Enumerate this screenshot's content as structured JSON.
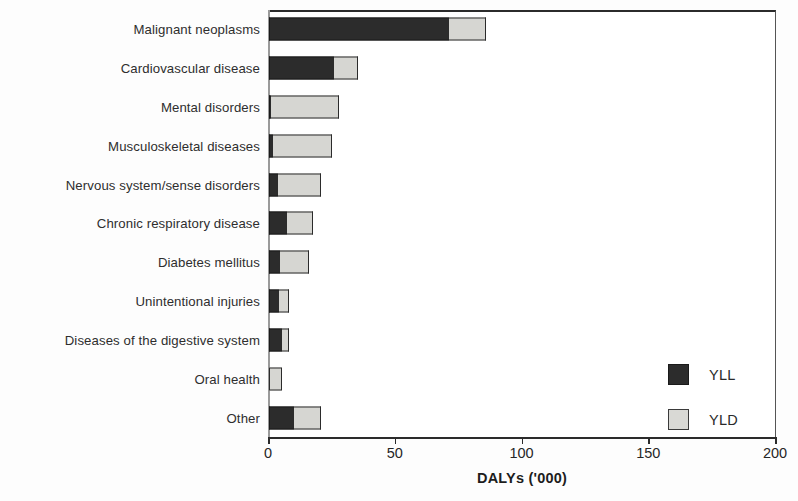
{
  "chart_data": {
    "type": "bar",
    "orientation": "horizontal",
    "stacked": true,
    "title": "",
    "xlabel": "DALYs ('000)",
    "ylabel": "",
    "xlim": [
      0,
      200
    ],
    "xticks": [
      0,
      50,
      100,
      150,
      200
    ],
    "xtick_labels": [
      "0",
      "50",
      "100",
      "150",
      "200"
    ],
    "grid": false,
    "legend_position": "bottom-right",
    "categories": [
      "Malignant neoplasms",
      "Cardiovascular disease",
      "Mental disorders",
      "Musculoskeletal diseases",
      "Nervous system/sense disorders",
      "Chronic respiratory disease",
      "Diabetes mellitus",
      "Unintentional injuries",
      "Diseases of the digestive system",
      "Oral health",
      "Other"
    ],
    "series": [
      {
        "name": "YLL",
        "color": "#2c2c2c",
        "values": [
          71,
          25.5,
          0.8,
          1.5,
          3.5,
          7,
          4.3,
          4,
          5,
          0,
          10
        ]
      },
      {
        "name": "YLD",
        "color": "#d6d6d2",
        "values": [
          14.5,
          9.5,
          26.8,
          23.3,
          17,
          10.4,
          11.5,
          4,
          2.8,
          5,
          10.5
        ]
      }
    ],
    "totals": [
      85.5,
      35,
      27.6,
      24.8,
      20.5,
      17.4,
      15.8,
      8,
      7.8,
      5,
      20.5
    ]
  },
  "legend": {
    "items": [
      {
        "label": "YLL",
        "swatch": "yll"
      },
      {
        "label": "YLD",
        "swatch": "yld"
      }
    ]
  }
}
